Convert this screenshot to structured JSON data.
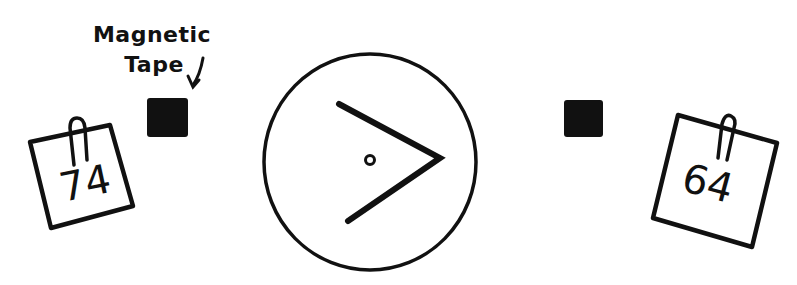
{
  "diagram": {
    "type": "comparison-gauge",
    "annotation": {
      "label_line1": "Magnetic",
      "label_line2": "Tape",
      "points_to": "left-magnet"
    },
    "left_card": {
      "value": "74"
    },
    "right_card": {
      "value": "64"
    },
    "gauge": {
      "symbol": ">",
      "meaning": "greater-than"
    },
    "colors": {
      "ink": "#111111",
      "background": "#ffffff"
    }
  }
}
